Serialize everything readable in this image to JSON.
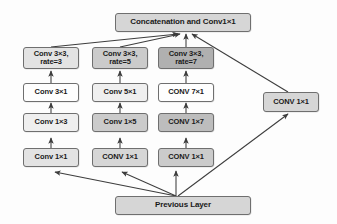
{
  "diagram": {
    "background_color": "#fdfdfd",
    "edge_color": "#404040",
    "border_color": "#6f6f6f"
  },
  "nodes": {
    "concatenation": {
      "label": "Concatenation and Conv1×1",
      "fill": "#d6d6d6"
    },
    "previous_layer": {
      "label": "Previous Layer",
      "fill": "#d6d6d6"
    },
    "shortcut": {
      "label": "CONV 1×1",
      "fill": "#d6d6d6"
    }
  },
  "branches": [
    {
      "name": "branch-rate-3",
      "stages": [
        {
          "label_line1": "Conv 3×3,",
          "label_line2": "rate=3",
          "fill": "#e3e3e3"
        },
        {
          "label_line1": "Conv 3×1",
          "label_line2": "",
          "fill": "#fefefe"
        },
        {
          "label_line1": "Conv 1×3",
          "label_line2": "",
          "fill": "#efefef"
        },
        {
          "label_line1": "Conv 1×1",
          "label_line2": "",
          "fill": "#e3e3e3"
        }
      ]
    },
    {
      "name": "branch-rate-5",
      "stages": [
        {
          "label_line1": "Conv 3×3,",
          "label_line2": "rate=5",
          "fill": "#cbcbcb"
        },
        {
          "label_line1": "Conv 5×1",
          "label_line2": "",
          "fill": "#efefef"
        },
        {
          "label_line1": "Conv 1×5",
          "label_line2": "",
          "fill": "#cbcbcb"
        },
        {
          "label_line1": "CONV 1×1",
          "label_line2": "",
          "fill": "#d6d6d6"
        }
      ]
    },
    {
      "name": "branch-rate-7",
      "stages": [
        {
          "label_line1": "Conv 3×3,",
          "label_line2": "rate=7",
          "fill": "#b0b0b0"
        },
        {
          "label_line1": "CONV 7×1",
          "label_line2": "",
          "fill": "#fefefe"
        },
        {
          "label_line1": "CONV 1×7",
          "label_line2": "",
          "fill": "#bdbdbd"
        },
        {
          "label_line1": "CONV 1×1",
          "label_line2": "",
          "fill": "#cbcbcb"
        }
      ]
    }
  ]
}
